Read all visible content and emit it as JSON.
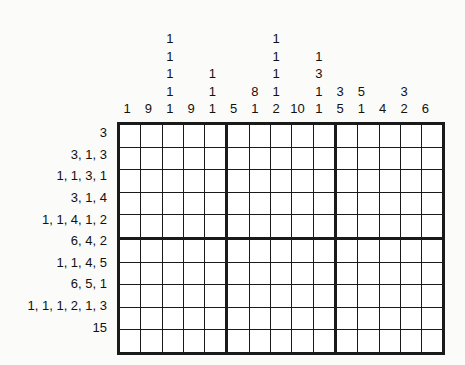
{
  "puzzle": {
    "type": "nonogram",
    "grid": {
      "columns": 15,
      "rows": 10,
      "block_separator_columns": [
        5,
        10
      ],
      "block_separator_rows": [
        5
      ],
      "cell_state": "empty"
    },
    "colors": {
      "background": "#fbfbfa",
      "cell_fill": "#ffffff",
      "line": "#1a1a1a",
      "text": "#111111"
    },
    "column_clues": [
      {
        "index": 1,
        "numbers": [
          1
        ]
      },
      {
        "index": 2,
        "numbers": [
          9
        ]
      },
      {
        "index": 3,
        "numbers": [
          1,
          1,
          1,
          1,
          1
        ]
      },
      {
        "index": 4,
        "numbers": [
          9
        ]
      },
      {
        "index": 5,
        "numbers": [
          1,
          1,
          1
        ]
      },
      {
        "index": 6,
        "numbers": [
          5
        ]
      },
      {
        "index": 7,
        "numbers": [
          8,
          1
        ]
      },
      {
        "index": 8,
        "numbers": [
          1,
          1,
          1,
          1,
          2
        ]
      },
      {
        "index": 9,
        "numbers": [
          10
        ]
      },
      {
        "index": 10,
        "numbers": [
          1,
          3,
          1,
          1
        ]
      },
      {
        "index": 11,
        "numbers": [
          3,
          5
        ]
      },
      {
        "index": 12,
        "numbers": [
          5,
          1
        ]
      },
      {
        "index": 13,
        "numbers": [
          4
        ]
      },
      {
        "index": 14,
        "numbers": [
          3,
          2
        ]
      },
      {
        "index": 15,
        "numbers": [
          6
        ]
      }
    ],
    "row_clues": [
      {
        "index": 1,
        "numbers": [
          3
        ],
        "label": "3"
      },
      {
        "index": 2,
        "numbers": [
          3,
          1,
          3
        ],
        "label": "3, 1, 3"
      },
      {
        "index": 3,
        "numbers": [
          1,
          1,
          3,
          1
        ],
        "label": "1, 1, 3, 1"
      },
      {
        "index": 4,
        "numbers": [
          3,
          1,
          4
        ],
        "label": "3, 1, 4"
      },
      {
        "index": 5,
        "numbers": [
          1,
          1,
          4,
          1,
          2
        ],
        "label": "1, 1, 4, 1, 2"
      },
      {
        "index": 6,
        "numbers": [
          6,
          4,
          2
        ],
        "label": "6, 4, 2"
      },
      {
        "index": 7,
        "numbers": [
          1,
          1,
          4,
          5
        ],
        "label": "1, 1, 4, 5"
      },
      {
        "index": 8,
        "numbers": [
          6,
          5,
          1
        ],
        "label": "6, 5, 1"
      },
      {
        "index": 9,
        "numbers": [
          1,
          1,
          1,
          2,
          1,
          3
        ],
        "label": "1, 1, 1, 2, 1, 3"
      },
      {
        "index": 10,
        "numbers": [
          15
        ],
        "label": "15"
      }
    ]
  }
}
